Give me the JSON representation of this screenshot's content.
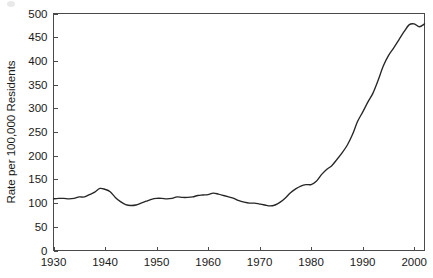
{
  "figure": {
    "background_color": "#ffffff",
    "axis_color": "#4a4a4a",
    "text_color": "#1a1a1a"
  },
  "chart_data": {
    "type": "line",
    "title": "",
    "subtitle": "",
    "xlabel": "",
    "ylabel": "Rate per 100,000 Residents",
    "xlim": [
      1930,
      2002
    ],
    "ylim": [
      0,
      500
    ],
    "grid": false,
    "legend": null,
    "legend_position": "none",
    "annotations": [],
    "line_color": "#262626",
    "x_tick_labels": [
      "1930",
      "1940",
      "1950",
      "1960",
      "1970",
      "1980",
      "1990",
      "2000"
    ],
    "x_ticks": [
      1930,
      1940,
      1950,
      1960,
      1970,
      1980,
      1990,
      2000
    ],
    "y_tick_labels": [
      "0",
      "50",
      "100",
      "150",
      "200",
      "250",
      "300",
      "350",
      "400",
      "450",
      "500"
    ],
    "y_ticks": [
      0,
      50,
      100,
      150,
      200,
      250,
      300,
      350,
      400,
      450,
      500
    ],
    "series": [
      {
        "name": "Rate per 100,000 Residents",
        "x": [
          1930,
          1931,
          1932,
          1933,
          1934,
          1935,
          1936,
          1937,
          1938,
          1939,
          1940,
          1941,
          1942,
          1943,
          1944,
          1945,
          1946,
          1947,
          1948,
          1949,
          1950,
          1951,
          1952,
          1953,
          1954,
          1955,
          1956,
          1957,
          1958,
          1959,
          1960,
          1961,
          1962,
          1963,
          1964,
          1965,
          1966,
          1967,
          1968,
          1969,
          1970,
          1971,
          1972,
          1973,
          1974,
          1975,
          1976,
          1977,
          1978,
          1979,
          1980,
          1981,
          1982,
          1983,
          1984,
          1985,
          1986,
          1987,
          1988,
          1989,
          1990,
          1991,
          1992,
          1993,
          1994,
          1995,
          1996,
          1997,
          1998,
          1999,
          2000,
          2001,
          2002
        ],
        "values": [
          109,
          110,
          110,
          109,
          110,
          113,
          113,
          118,
          123,
          131,
          129,
          124,
          112,
          103,
          97,
          95,
          96,
          100,
          104,
          108,
          110,
          110,
          109,
          110,
          113,
          112,
          112,
          113,
          116,
          117,
          118,
          121,
          119,
          116,
          113,
          110,
          105,
          102,
          100,
          100,
          98,
          96,
          94,
          96,
          102,
          111,
          122,
          130,
          136,
          139,
          139,
          146,
          160,
          171,
          179,
          192,
          206,
          222,
          244,
          272,
          292,
          313,
          332,
          359,
          389,
          411,
          427,
          444,
          461,
          476,
          478,
          472,
          478
        ]
      }
    ]
  }
}
